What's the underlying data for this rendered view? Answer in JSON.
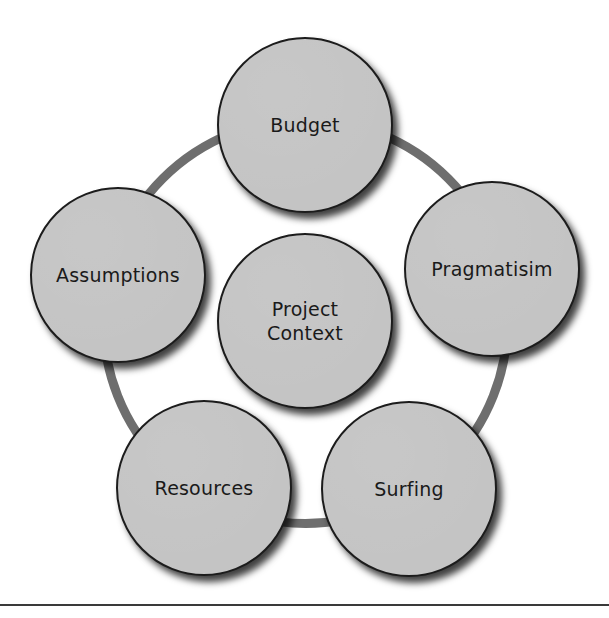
{
  "diagram": {
    "type": "cycle",
    "ring": {
      "center_x": 305,
      "center_y": 321,
      "radius": 202,
      "stroke": 9,
      "color": "#6e6e6e"
    },
    "node_style": {
      "radius": 88,
      "fill": "#c4c4c4",
      "border": "#1c1c1c",
      "text_color": "#1a1a1a"
    },
    "center_node": {
      "id": "project-context",
      "label": "Project\nContext",
      "x": 305,
      "y": 321
    },
    "nodes": [
      {
        "id": "budget",
        "label": "Budget",
        "x": 305,
        "y": 125
      },
      {
        "id": "pragmatisim",
        "label": "Pragmatisim",
        "x": 492,
        "y": 269
      },
      {
        "id": "surfing",
        "label": "Surfing",
        "x": 409,
        "y": 489
      },
      {
        "id": "resources",
        "label": "Resources",
        "x": 204,
        "y": 488
      },
      {
        "id": "assumptions",
        "label": "Assumptions",
        "x": 118,
        "y": 275
      }
    ]
  },
  "footer_rule": {
    "y": 604,
    "color": "#3a3a3a"
  }
}
